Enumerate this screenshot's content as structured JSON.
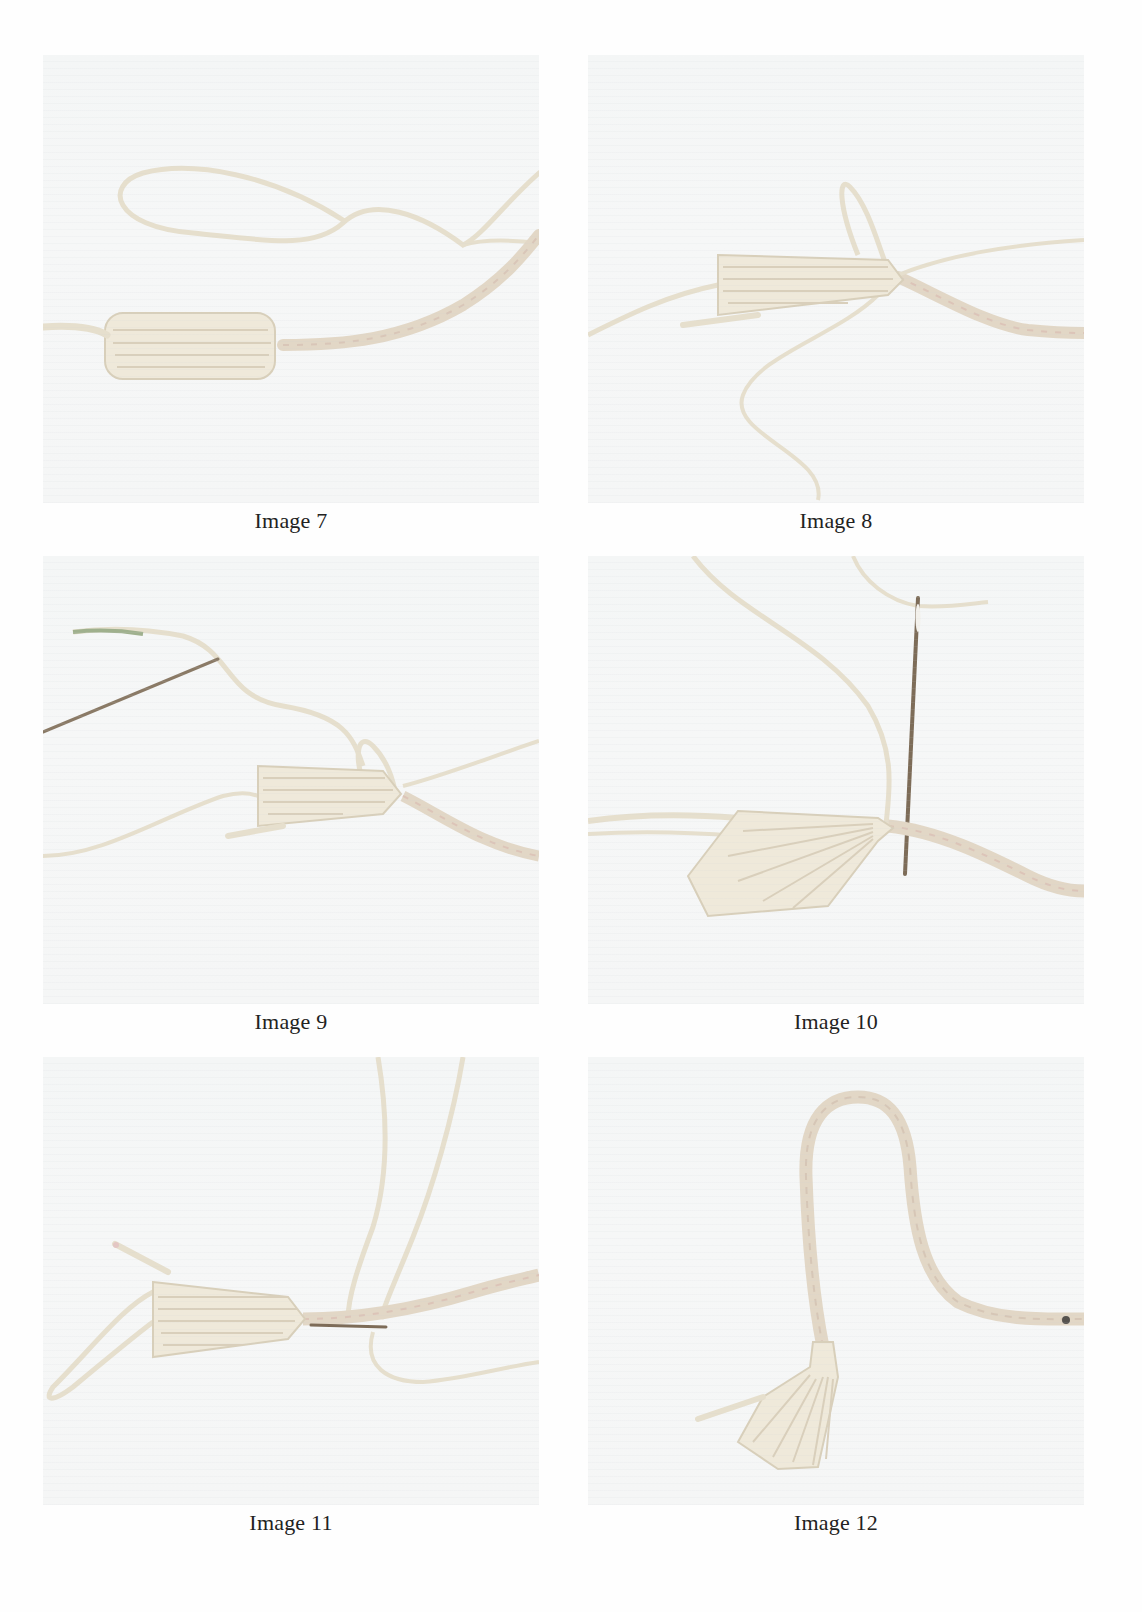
{
  "page": {
    "figures": [
      {
        "id": "img7",
        "caption": "Image 7",
        "photo_subject": "tassel bundle wrapped with loose yarn loop beside braided cord"
      },
      {
        "id": "img8",
        "caption": "Image 8",
        "photo_subject": "tassel tied at cord end with loop and loose yarn"
      },
      {
        "id": "img9",
        "caption": "Image 9",
        "photo_subject": "needle threaded with yarn approaching tied tassel"
      },
      {
        "id": "img10",
        "caption": "Image 10",
        "photo_subject": "vertical needle passing through cord at tassel neck"
      },
      {
        "id": "img11",
        "caption": "Image 11",
        "photo_subject": "needle inserted horizontally through tassel neck and cord"
      },
      {
        "id": "img12",
        "caption": "Image 12",
        "photo_subject": "finished tassel hanging from arched braided cord"
      }
    ],
    "colors": {
      "background": "#fefefe",
      "photo_background": "#f5f6f6",
      "yarn": "#ece6d6",
      "yarn_shadow": "#d8cfba",
      "needle": "#8a7a66",
      "cord_tint": "#e3d3c5"
    }
  }
}
